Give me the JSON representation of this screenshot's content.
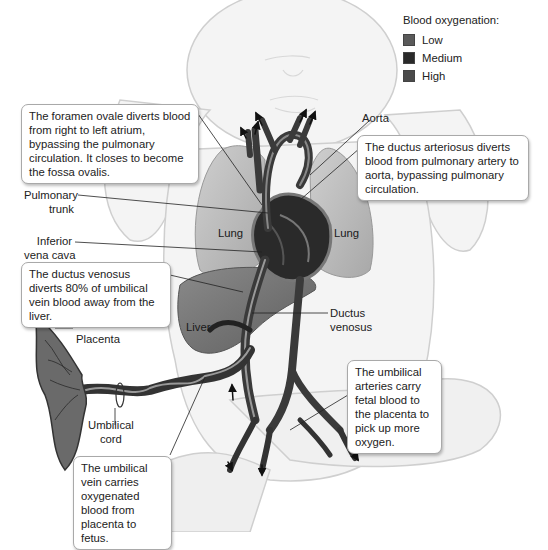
{
  "legend": {
    "title": "Blood oxygenation:",
    "items": [
      {
        "label": "Low",
        "color": "#5a5a5a"
      },
      {
        "label": "Medium",
        "color": "#2a2a2a"
      },
      {
        "label": "High",
        "color": "#4a4a4a"
      }
    ]
  },
  "callouts": {
    "foramen_ovale": "The foramen ovale diverts blood from right to left atrium, bypassing the pulmonary circulation. It closes to become the fossa ovalis.",
    "ductus_arteriosus": "The ductus arteriosus diverts blood from pulmonary artery to aorta, bypassing pulmonary circulation.",
    "ductus_venosus": "The ductus venosus diverts 80% of umbilical vein blood away from the liver.",
    "umbilical_arteries": "The umbilical arteries carry fetal blood to the placenta to pick up more oxygen.",
    "umbilical_vein": "The umbilical vein carries oxygenated blood from placenta to fetus."
  },
  "labels": {
    "aorta": "Aorta",
    "pulmonary_trunk_1": "Pulmonary",
    "pulmonary_trunk_2": "trunk",
    "inferior_vena_cava_1": "Inferior",
    "inferior_vena_cava_2": "vena cava",
    "ductus_venosus_1": "Ductus",
    "ductus_venosus_2": "venosus",
    "placenta": "Placenta",
    "umbilical_cord_1": "Umbilical",
    "umbilical_cord_2": "cord"
  },
  "organs": {
    "lung_left": "Lung",
    "lung_right": "Lung",
    "liver": "Liver"
  }
}
